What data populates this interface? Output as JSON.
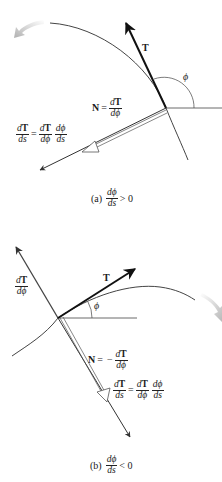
{
  "figure_a": {
    "caption_tag": "(a)",
    "caption_frac_num": "dϕ",
    "caption_frac_den": "ds",
    "caption_rel": "> 0",
    "tangent_label": "T",
    "angle_label": "ϕ",
    "normal_label_lhs": "N",
    "normal_eq": "=",
    "normal_frac_num_d": "d",
    "normal_frac_num_T": "T",
    "normal_frac_den": "dϕ",
    "chain_lhs_num_d": "d",
    "chain_lhs_num_T": "T",
    "chain_lhs_den": "ds",
    "chain_eq": "=",
    "chain_r1_num_d": "d",
    "chain_r1_num_T": "T",
    "chain_r1_den": "dϕ",
    "chain_r2_num": "dϕ",
    "chain_r2_den": "ds"
  },
  "figure_b": {
    "caption_tag": "(b)",
    "caption_frac_num": "dϕ",
    "caption_frac_den": "ds",
    "caption_rel": "< 0",
    "tangent_label": "T",
    "angle_label": "ϕ",
    "dTdphi_num_d": "d",
    "dTdphi_num_T": "T",
    "dTdphi_den": "dϕ",
    "normal_label_lhs": "N",
    "normal_eq": "=",
    "normal_minus": "−",
    "normal_frac_num_d": "d",
    "normal_frac_num_T": "T",
    "normal_frac_den": "dϕ",
    "chain_lhs_num_d": "d",
    "chain_lhs_num_T": "T",
    "chain_lhs_den": "ds",
    "chain_eq": "=",
    "chain_r1_num_d": "d",
    "chain_r1_num_T": "T",
    "chain_r1_den": "dϕ",
    "chain_r2_num": "dϕ",
    "chain_r2_den": "ds"
  },
  "colors": {
    "curve": "#444444",
    "vector": "#111111",
    "motion_arrow": "#bdbdbd",
    "background": "#ffffff"
  }
}
